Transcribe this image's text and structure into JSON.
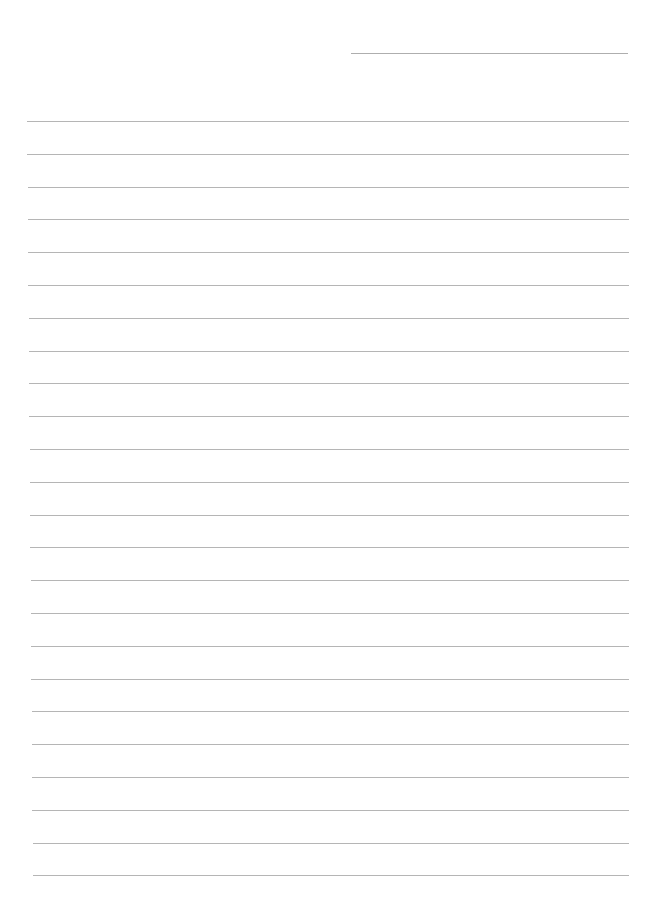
{
  "page": {
    "type": "lined-paper",
    "background_color": "#ffffff",
    "line_color": "#a8a8a8",
    "header_line": {
      "x": 351,
      "y": 53,
      "width": 277
    },
    "rules": {
      "count": 24,
      "start_y": 121,
      "spacing": 32.8,
      "left": 27,
      "right": 629
    },
    "text": ""
  }
}
